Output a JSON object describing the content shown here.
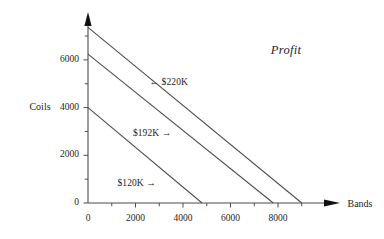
{
  "chart_data": {
    "type": "line",
    "title": "Profit",
    "xlabel": "Bands",
    "ylabel": "Coils",
    "xlim": [
      0,
      9600
    ],
    "ylim": [
      0,
      7700
    ],
    "grid": false,
    "legend_position": "inline-annotations",
    "x_ticks_major": [
      0,
      2000,
      4000,
      6000,
      8000
    ],
    "x_ticks_minor": [
      1000,
      3000,
      5000,
      7000,
      9000
    ],
    "y_ticks_major": [
      0,
      2000,
      4000,
      6000
    ],
    "y_ticks_minor": [
      1000,
      3000,
      5000,
      7000
    ],
    "x_tick_labels": [
      "0",
      "2000",
      "4000",
      "6000",
      "8000"
    ],
    "y_tick_labels": [
      "0",
      "2000",
      "4000",
      "6000"
    ],
    "series": [
      {
        "name": "$120K",
        "label": "$120K →",
        "arrow": "right",
        "x": [
          0,
          4800
        ],
        "y": [
          4000,
          0
        ],
        "x_intercept": 4800,
        "y_intercept": 4000,
        "label_x": 2050,
        "label_y": 800
      },
      {
        "name": "$192K",
        "label": "$192K →",
        "arrow": "right",
        "x": [
          0,
          7800
        ],
        "y": [
          6240,
          0
        ],
        "x_intercept": 7800,
        "y_intercept": 6240,
        "label_x": 2700,
        "label_y": 2900
      },
      {
        "name": "$220K",
        "label": "← $220K",
        "arrow": "left",
        "x": [
          0,
          9000
        ],
        "y": [
          7360,
          0
        ],
        "x_intercept": 9000,
        "y_intercept": 7360,
        "label_x": 3400,
        "label_y": 5050
      }
    ],
    "colors": {
      "line": "#4d4d4d",
      "axis": "#4d4d4d",
      "text": "#262626",
      "background": "#ffffff"
    }
  },
  "axes": {
    "y_axis_name": "Coils",
    "x_axis_name": "Bands"
  }
}
